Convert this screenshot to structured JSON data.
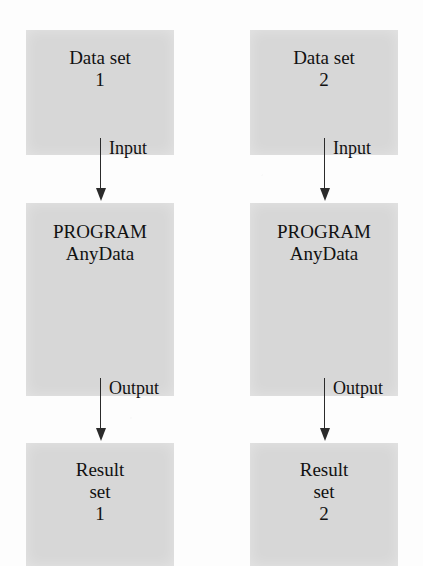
{
  "diagram": {
    "type": "flowchart",
    "box_fill_color": "#d7d7d7",
    "page_color": "#fdfdfd",
    "arrow_color": "#2b2b2b",
    "columns": [
      {
        "id": "pipeline-1",
        "data_node": {
          "line1": "Data set",
          "line2": "1"
        },
        "input_edge": {
          "label": "Input"
        },
        "program_node": {
          "line1": "PROGRAM",
          "line2": "AnyData"
        },
        "output_edge": {
          "label": "Output"
        },
        "result_node": {
          "line1": "Result",
          "line2": "set",
          "line3": "1"
        }
      },
      {
        "id": "pipeline-2",
        "data_node": {
          "line1": "Data set",
          "line2": "2"
        },
        "input_edge": {
          "label": "Input"
        },
        "program_node": {
          "line1": "PROGRAM",
          "line2": "AnyData"
        },
        "output_edge": {
          "label": "Output"
        },
        "result_node": {
          "line1": "Result",
          "line2": "set",
          "line3": "2"
        }
      }
    ]
  }
}
